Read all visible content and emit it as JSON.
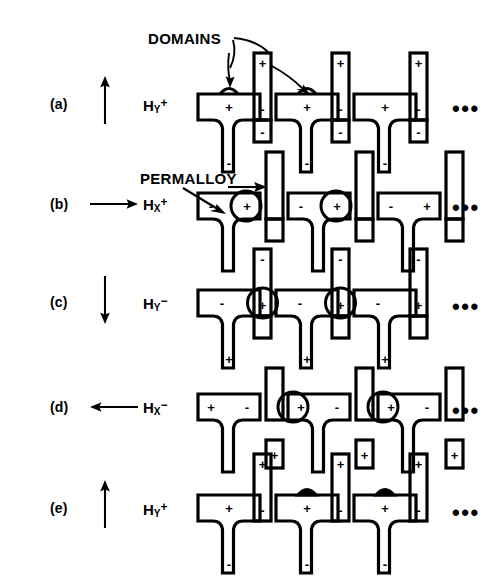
{
  "figure": {
    "background_color": "#ffffff",
    "ink_color": "#000000",
    "ellipsis_glyph": "•••"
  },
  "callouts": [
    {
      "id": "domains",
      "label": "DOMAINS",
      "x": 148,
      "y": 38,
      "leaders": 2
    },
    {
      "id": "permalloy",
      "label": "PERMALLOY",
      "x": 140,
      "y": 178,
      "leaders": 2
    }
  ],
  "rows": [
    {
      "id": "a",
      "row_label": "(a)",
      "field_symbol": "H",
      "field_axis": "Y",
      "field_polarity": "+",
      "arrow_direction": "up",
      "arrow_name": "field-arrow-up",
      "tbar_top_sign": "+",
      "tbar_stem_sign": "-",
      "tbar_top_sign_position": "center",
      "bar_top_sign": "+",
      "bar_bottom_sign": "-",
      "domain_marker": "dome-open",
      "domain_marker_positions": [
        0,
        1
      ],
      "y": 70
    },
    {
      "id": "b",
      "row_label": "(b)",
      "field_symbol": "H",
      "field_axis": "X",
      "field_polarity": "+",
      "arrow_direction": "right",
      "arrow_name": "field-arrow-right",
      "tbar_top_sign_left": "-",
      "tbar_top_sign_right": "+",
      "bar_top_sign": "-",
      "bar_bottom_sign": "-",
      "domain_marker": "circle",
      "domain_marker_positions": [
        0,
        1
      ],
      "y": 165
    },
    {
      "id": "c",
      "row_label": "(c)",
      "field_symbol": "H",
      "field_axis": "Y",
      "field_polarity": "−",
      "arrow_direction": "down",
      "arrow_name": "field-arrow-down",
      "tbar_top_sign": "-",
      "tbar_stem_sign": "+",
      "tbar_top_sign_position": "center",
      "bar_top_sign": "-",
      "bar_bottom_sign": "+",
      "domain_marker": "circle",
      "domain_marker_positions": [
        0,
        1
      ],
      "y": 262
    },
    {
      "id": "d",
      "row_label": "(d)",
      "field_symbol": "H",
      "field_axis": "X",
      "field_polarity": "−",
      "arrow_direction": "left",
      "arrow_name": "field-arrow-left",
      "tbar_top_sign_left": "+",
      "tbar_top_sign_right": "-",
      "bar_top_sign": "+",
      "bar_bottom_sign": "+",
      "domain_marker": "circle",
      "domain_marker_positions": [
        1,
        2
      ],
      "y": 368
    },
    {
      "id": "e",
      "row_label": "(e)",
      "field_symbol": "H",
      "field_axis": "Y",
      "field_polarity": "+",
      "arrow_direction": "up",
      "arrow_name": "field-arrow-up",
      "tbar_top_sign": "+",
      "tbar_stem_sign": "-",
      "tbar_top_sign_position": "center",
      "bar_top_sign": "+",
      "bar_bottom_sign": "-",
      "domain_marker": "dome-filled",
      "domain_marker_positions": [
        1,
        2
      ],
      "y": 468
    }
  ],
  "geometry": {
    "label_x": 50,
    "arrow_x": 105,
    "field_x": 148,
    "pattern_start_x": 196,
    "cell_pitch": 78,
    "tbar_count": 3,
    "bar_count": 3,
    "ellipsis_x": 452
  }
}
